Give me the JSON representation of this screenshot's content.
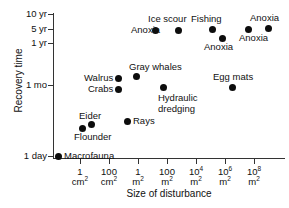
{
  "chart_data": {
    "type": "scatter",
    "title": "",
    "xlabel": "Size of disturbance",
    "ylabel": "Recovery time",
    "grid": false,
    "legend": "none",
    "xaxis": {
      "scale": "log",
      "ticks": [
        {
          "label_top": "1",
          "label_bottom": "cm",
          "exponent": "2",
          "px": 80
        },
        {
          "label_top": "100",
          "label_bottom": "cm",
          "exponent": "2",
          "px": 109
        },
        {
          "label_top": "1",
          "label_bottom": "m",
          "exponent": "2",
          "px": 138
        },
        {
          "label_top": "100",
          "label_bottom": "m",
          "exponent": "2",
          "px": 167
        },
        {
          "label_top": "10",
          "label_top_exp": "4",
          "label_bottom": "m",
          "exponent": "2",
          "px": 196
        },
        {
          "label_top": "10",
          "label_top_exp": "6",
          "label_bottom": "m",
          "exponent": "2",
          "px": 225
        },
        {
          "label_top": "10",
          "label_top_exp": "8",
          "label_bottom": "m",
          "exponent": "2",
          "px": 254
        }
      ]
    },
    "yaxis": {
      "scale": "log",
      "ticks": [
        {
          "label": "10 yr",
          "px": 14
        },
        {
          "label": "5 yr",
          "px": 29
        },
        {
          "label": "1 yr",
          "px": 43
        },
        {
          "label": "1 mo",
          "px": 85
        },
        {
          "label": "1 day",
          "px": 156
        }
      ]
    },
    "points": [
      {
        "label": "Macrofauna",
        "x_px": 58,
        "y_px": 156,
        "label_x": 64,
        "label_y": 151,
        "x_value": "~0.3 cm2",
        "y_value": "1 day"
      },
      {
        "label": "Flounder",
        "x_px": 82,
        "y_px": 128,
        "label_x": 74,
        "label_y": 132,
        "x_value": "~6 cm2",
        "y_value": "~2 days"
      },
      {
        "label": "Eider",
        "x_px": 91,
        "y_px": 124,
        "label_x": 79,
        "label_y": 111,
        "x_value": "~25 cm2",
        "y_value": "~3 days"
      },
      {
        "label": "Rays",
        "x_px": 127,
        "y_px": 121,
        "label_x": 133,
        "label_y": 116,
        "x_value": "~0.5 m2",
        "y_value": "~4 days"
      },
      {
        "label": "Walrus",
        "x_px": 118,
        "y_px": 78,
        "label_x": 84,
        "label_y": 73,
        "x_value": "~0.3 m2",
        "y_value": "~1.5 mo"
      },
      {
        "label": "Crabs",
        "x_px": 118,
        "y_px": 89,
        "label_x": 88,
        "label_y": 84,
        "x_value": "~0.3 m2",
        "y_value": "~1 mo"
      },
      {
        "label": "Gray whales",
        "x_px": 136,
        "y_px": 76,
        "label_x": 129,
        "label_y": 62,
        "x_value": "~1 m2",
        "y_value": "~1.5 mo"
      },
      {
        "label": "Hydraulic dredging",
        "x_px": 163,
        "y_px": 87,
        "label_x": 158,
        "label_y": 93,
        "x_value": "~70 m2",
        "y_value": "~1 mo"
      },
      {
        "label": "Egg mats",
        "x_px": 232,
        "y_px": 87,
        "label_x": 213,
        "label_y": 72,
        "x_value": "~10e6 m2",
        "y_value": "~1 mo"
      },
      {
        "label": "Anoxia",
        "x_px": 155,
        "y_px": 30,
        "label_x": 131,
        "label_y": 25,
        "x_value": "~150 m2",
        "y_value": "~6 yr"
      },
      {
        "label": "Ice scour",
        "x_px": 178,
        "y_px": 30,
        "label_x": 148,
        "label_y": 14,
        "x_value": "~5000 m2",
        "y_value": "~6 yr"
      },
      {
        "label": "Fishing",
        "x_px": 212,
        "y_px": 29,
        "label_x": 191,
        "label_y": 14,
        "x_value": "~10e4 m2",
        "y_value": "~6 yr"
      },
      {
        "label": "Anoxia",
        "x_px": 222,
        "y_px": 38,
        "label_x": 204,
        "label_y": 42,
        "x_value": "~10e5 m2",
        "y_value": "~4 yr"
      },
      {
        "label": "Anoxia",
        "x_px": 248,
        "y_px": 29,
        "label_x": 239,
        "label_y": 33,
        "x_value": "~10e6 m2",
        "y_value": "~6 yr"
      },
      {
        "label": "Anoxia",
        "x_px": 268,
        "y_px": 28,
        "label_x": 250,
        "label_y": 13,
        "x_value": "~10e8 m2",
        "y_value": "~6 yr"
      }
    ]
  }
}
